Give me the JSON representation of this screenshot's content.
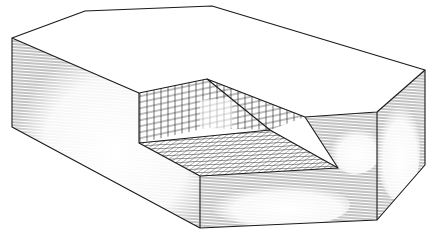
{
  "figure": {
    "colors": {
      "stroke": "#1a1a1a",
      "background": "#ffffff",
      "hatch": "#333333"
    },
    "parts": [
      "top-face",
      "left-face",
      "front-face",
      "right-face",
      "pocket-back-wall-grid",
      "pocket-floor-grid"
    ]
  }
}
